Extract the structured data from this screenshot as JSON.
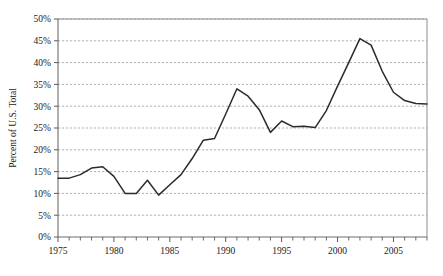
{
  "chart_data": {
    "type": "line",
    "title": "",
    "xlabel": "",
    "ylabel": "Percent of U.S. Total",
    "xlim": [
      1975,
      2008
    ],
    "ylim": [
      0,
      50
    ],
    "grid": true,
    "legend": false,
    "y_tick_labels": [
      "0%",
      "5%",
      "10%",
      "15%",
      "20%",
      "25%",
      "30%",
      "35%",
      "40%",
      "45%",
      "50%"
    ],
    "y_tick_values": [
      0,
      5,
      10,
      15,
      20,
      25,
      30,
      35,
      40,
      45,
      50
    ],
    "x_tick_labels": [
      "1975",
      "1980",
      "1985",
      "1990",
      "1995",
      "2000",
      "2005"
    ],
    "x_tick_values": [
      1975,
      1980,
      1985,
      1990,
      1995,
      2000,
      2005
    ],
    "x_minor_tick_interval": 1,
    "x": [
      1975,
      1976,
      1977,
      1978,
      1979,
      1980,
      1981,
      1982,
      1983,
      1984,
      1985,
      1986,
      1987,
      1988,
      1989,
      1990,
      1991,
      1992,
      1993,
      1994,
      1995,
      1996,
      1997,
      1998,
      1999,
      2000,
      2001,
      2002,
      2003,
      2004,
      2005,
      2006,
      2007,
      2008
    ],
    "values": [
      13.5,
      13.5,
      14.3,
      15.8,
      16.1,
      13.9,
      10.0,
      10.0,
      13.0,
      9.6,
      12.0,
      14.3,
      18.0,
      22.2,
      22.6,
      28.2,
      34.0,
      32.3,
      29.2,
      24.0,
      26.6,
      25.3,
      25.4,
      25.1,
      29.0,
      34.6,
      40.0,
      45.5,
      44.0,
      38.0,
      33.2,
      31.3,
      30.6,
      30.5
    ],
    "series_color": "#2b2b2b",
    "grid_color": "#8c8c8c"
  },
  "geometry": {
    "plot_left": 58,
    "plot_right": 427,
    "plot_top": 19,
    "plot_bottom": 237
  }
}
